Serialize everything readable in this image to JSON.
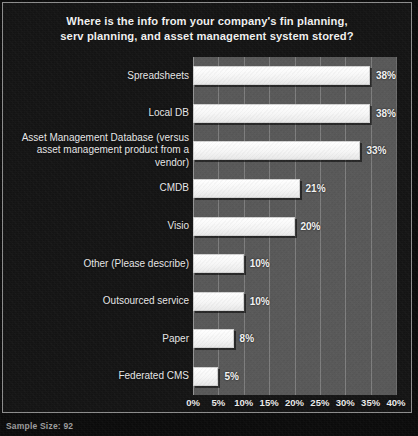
{
  "chart_data": {
    "type": "bar",
    "orientation": "horizontal",
    "title": "Where is the info from your company's fin planning, serv planning, and asset management system stored?",
    "title_lines": [
      "Where is the info from your company's fin planning,",
      "serv planning, and asset management system stored?"
    ],
    "categories": [
      "Spreadsheets",
      "Local DB",
      "Asset Management Database (versus asset management product from a vendor)",
      "CMDB",
      "Visio",
      "Other (Please describe)",
      "Outsourced service",
      "Paper",
      "Federated CMS"
    ],
    "category_lines": [
      [
        "Spreadsheets"
      ],
      [
        "Local DB"
      ],
      [
        "Asset Management Database (versus",
        "asset management product from a",
        "vendor)"
      ],
      [
        "CMDB"
      ],
      [
        "Visio"
      ],
      [
        "Other (Please describe)"
      ],
      [
        "Outsourced service"
      ],
      [
        "Paper"
      ],
      [
        "Federated CMS"
      ]
    ],
    "values": [
      38,
      38,
      33,
      21,
      20,
      10,
      10,
      8,
      5
    ],
    "value_labels": [
      "38%",
      "38%",
      "33%",
      "21%",
      "20%",
      "10%",
      "10%",
      "8%",
      "5%"
    ],
    "xlabel": "",
    "ylabel": "",
    "xlim": [
      0,
      40
    ],
    "xticks": [
      0,
      5,
      10,
      15,
      20,
      25,
      30,
      35,
      40
    ],
    "xtick_labels": [
      "0%",
      "5%",
      "10%",
      "15%",
      "20%",
      "25%",
      "30%",
      "35%",
      "40%"
    ],
    "grid": true,
    "grid_axis": "x",
    "legend": false,
    "bar_color": "#fbfbfb",
    "plot_background": "#585858",
    "figure_background": "#141414",
    "text_color": "#f0f0f0"
  },
  "caption": {
    "text": "Sample Size: 92"
  }
}
